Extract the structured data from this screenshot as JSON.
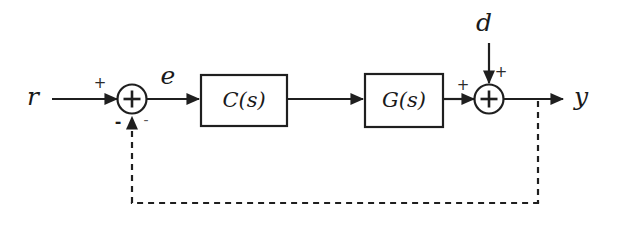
{
  "diagram": {
    "background_color": "#ffffff",
    "line_color": "#1f1f1f",
    "signals": {
      "reference": "r",
      "error": "e",
      "disturbance": "d",
      "output": "y"
    },
    "blocks": [
      {
        "id": "controller",
        "label": "C(s)"
      },
      {
        "id": "plant",
        "label": "G(s)"
      }
    ],
    "summing_junctions": [
      {
        "id": "error-junction",
        "glyph": "+",
        "signs": {
          "reference_input": "+",
          "feedback_input_left": "-",
          "feedback_input_right": "-"
        }
      },
      {
        "id": "disturbance-junction",
        "glyph": "+",
        "signs": {
          "plant_input": "+",
          "disturbance_input": "+"
        }
      }
    ],
    "feedback": {
      "style": "dashed",
      "description": "output fed back to error junction"
    }
  }
}
